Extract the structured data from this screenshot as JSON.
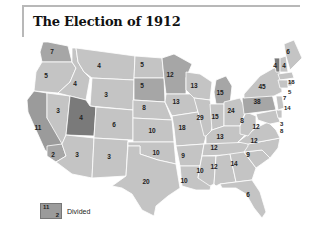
{
  "title": "The Election of 1912",
  "colors": {
    "light": "#c4c4c4",
    "medium": "#a6a6a6",
    "dark": "#7a7a7a",
    "divided": "#9b9b9b",
    "border": "#ffffff"
  },
  "legend": {
    "sample_top": "11",
    "sample_bottom": "2",
    "label": "Divided"
  },
  "states": [
    {
      "id": "WA",
      "label": "7"
    },
    {
      "id": "OR",
      "label": "5"
    },
    {
      "id": "CA",
      "label": "11"
    },
    {
      "id": "CA2",
      "label": "2"
    },
    {
      "id": "ID",
      "label": "4"
    },
    {
      "id": "NV",
      "label": "3"
    },
    {
      "id": "MT",
      "label": "4"
    },
    {
      "id": "WY",
      "label": "3"
    },
    {
      "id": "UT",
      "label": "4"
    },
    {
      "id": "CO",
      "label": "6"
    },
    {
      "id": "AZ",
      "label": "3"
    },
    {
      "id": "NM",
      "label": "3"
    },
    {
      "id": "ND",
      "label": "5"
    },
    {
      "id": "SD",
      "label": "5"
    },
    {
      "id": "NE",
      "label": "8"
    },
    {
      "id": "KS",
      "label": "10"
    },
    {
      "id": "OK",
      "label": "10"
    },
    {
      "id": "TX",
      "label": "20"
    },
    {
      "id": "MN",
      "label": "12"
    },
    {
      "id": "IA",
      "label": "13"
    },
    {
      "id": "MO",
      "label": "18"
    },
    {
      "id": "AR",
      "label": "9"
    },
    {
      "id": "LA",
      "label": "10"
    },
    {
      "id": "WI",
      "label": "13"
    },
    {
      "id": "IL",
      "label": "29"
    },
    {
      "id": "MI",
      "label": "15"
    },
    {
      "id": "IN",
      "label": "15"
    },
    {
      "id": "OH",
      "label": "24"
    },
    {
      "id": "KY",
      "label": "13"
    },
    {
      "id": "TN",
      "label": "12"
    },
    {
      "id": "MS",
      "label": "10"
    },
    {
      "id": "AL",
      "label": "12"
    },
    {
      "id": "GA",
      "label": "14"
    },
    {
      "id": "FL",
      "label": "6"
    },
    {
      "id": "SC",
      "label": "9"
    },
    {
      "id": "NC",
      "label": "12"
    },
    {
      "id": "VA",
      "label": "12"
    },
    {
      "id": "WV",
      "label": "8"
    },
    {
      "id": "PA",
      "label": "38"
    },
    {
      "id": "NY",
      "label": "45"
    },
    {
      "id": "VT",
      "label": "4"
    },
    {
      "id": "NH",
      "label": "4"
    },
    {
      "id": "ME",
      "label": "6"
    },
    {
      "id": "MA",
      "label": "18"
    },
    {
      "id": "RI",
      "label": "5"
    },
    {
      "id": "CT",
      "label": "7"
    },
    {
      "id": "NJ",
      "label": "14"
    },
    {
      "id": "DE",
      "label": "3"
    },
    {
      "id": "MD",
      "label": "8"
    }
  ]
}
